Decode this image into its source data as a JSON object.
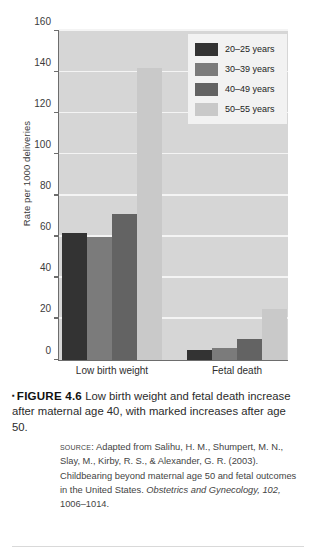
{
  "figure": {
    "marker": "▪",
    "label": "FIGURE 4.6",
    "caption": "Low birth weight and fetal death increase after maternal age 40, with marked increases after age 50.",
    "source_label": "Source:",
    "source_text_1": "Adapted from Salihu, H. M., Shumpert, M. N., Slay, M., Kirby, R. S., & Alexander, G. R. (2003). Childbearing beyond maternal age 50 and fetal outcomes in the United States. ",
    "source_journal": "Obstetrics and Gynecology, 102,",
    "source_text_2": " 1006–1014."
  },
  "chart_data": {
    "type": "bar",
    "title": "",
    "xlabel": "",
    "ylabel": "Rate per 1000 deliveries",
    "ylim": [
      0,
      160
    ],
    "ytick_step": 20,
    "yticks": [
      0,
      20,
      40,
      60,
      80,
      100,
      120,
      140,
      160
    ],
    "ytick_labels": [
      "0",
      "20",
      "40",
      "60",
      "80",
      "100",
      "120",
      "140",
      "160"
    ],
    "grid": true,
    "legend_position": "top-right",
    "categories": [
      "Low birth weight",
      "Fetal death"
    ],
    "series": [
      {
        "name": "20–25 years",
        "color": "#333333",
        "values": [
          62,
          5
        ]
      },
      {
        "name": "30–39 years",
        "color": "#7b7b7b",
        "values": [
          60,
          6
        ]
      },
      {
        "name": "40–49 years",
        "color": "#636363",
        "values": [
          71,
          10
        ]
      },
      {
        "name": "50–55 years",
        "color": "#c9c9c9",
        "values": [
          142,
          25
        ]
      }
    ],
    "plot_background": "#d6d6d6",
    "gridline_color": "#f4f4f4",
    "axis_color": "#6d6d6d"
  }
}
